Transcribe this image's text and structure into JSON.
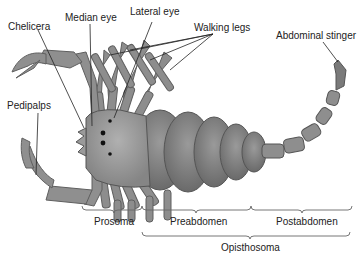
{
  "diagram": {
    "labels": {
      "chelicera": "Chelicera",
      "median_eye": "Median eye",
      "lateral_eye": "Lateral eye",
      "walking_legs": "Walking legs",
      "abdominal_stinger": "Abdominal stinger",
      "pedipalps": "Pedipalps"
    },
    "regions": {
      "prosoma": "Prosoma",
      "preabdomen": "Preabdomen",
      "postabdomen": "Postabdomen",
      "opisthosoma": "Opisthosoma"
    },
    "colors": {
      "body": "#8a8a8a",
      "body_dark": "#6e6e6e",
      "body_light": "#a5a5a5",
      "line": "#222222",
      "brace": "#666666"
    }
  }
}
